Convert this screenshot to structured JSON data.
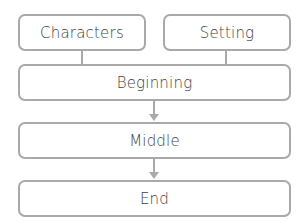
{
  "diagram": {
    "type": "story-structure-flowchart",
    "top_row": [
      {
        "label": "Characters"
      },
      {
        "label": "Setting"
      }
    ],
    "sequence": [
      {
        "label": "Beginning"
      },
      {
        "label": "Middle"
      },
      {
        "label": "End"
      }
    ],
    "colors": {
      "border": "#a9a9a9",
      "text": "#404040",
      "background": "#ffffff"
    }
  }
}
